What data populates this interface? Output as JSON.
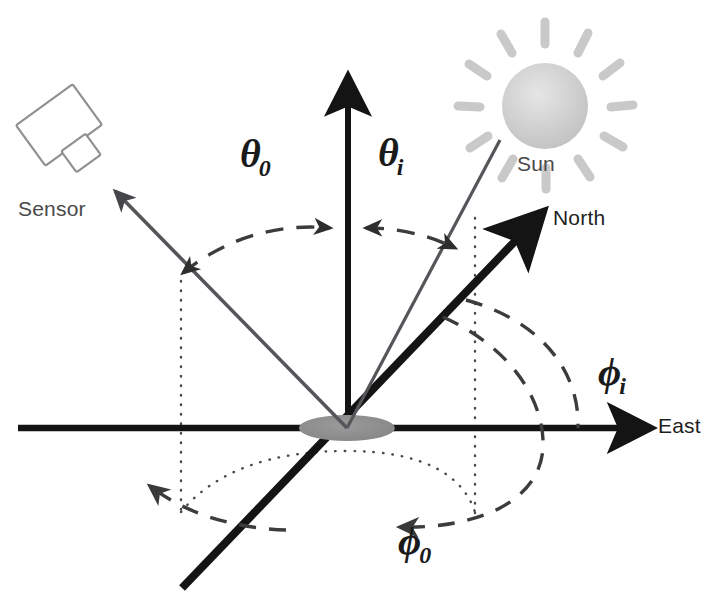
{
  "diagram": {
    "background_color": "#ffffff",
    "labels": {
      "sensor": "Sensor",
      "sun": "Sun",
      "north": "North",
      "east": "East",
      "theta_zero_glyph": "θ",
      "theta_zero_sub": "0",
      "theta_i_glyph": "θ",
      "theta_i_sub": "i",
      "phi_i_glyph": "ϕ",
      "phi_i_sub": "i",
      "phi_zero_glyph": "ϕ",
      "phi_zero_sub": "0"
    },
    "colors": {
      "axis_black": "#141414",
      "ray_gray": "#55565a",
      "sun_gray": "#c9c9c9",
      "sun_core": "#d8d8d8",
      "origin_disk": "#8a8a8a",
      "dashed_arc": "#3c3c3c",
      "dotted_line": "#4a4a4a",
      "sensor_outline": "#8f8f8f",
      "text_gray": "#4a4a4a"
    },
    "geometry": {
      "origin_x": 347,
      "origin_y": 428,
      "zenith_tip_x": 348,
      "zenith_tip_y": 70,
      "east_tip_x": 655,
      "east_tip_y": 428,
      "west_end_x": 18,
      "west_end_y": 428,
      "north_tip_x": 548,
      "north_tip_y": 207,
      "south_end_x": 182,
      "south_end_y": 588,
      "sensor_ray_tip_x": 110,
      "sensor_ray_tip_y": 186,
      "sun_ray_end_x": 500,
      "sun_ray_end_y": 140,
      "origin_disk_rx": 48,
      "origin_disk_ry": 13
    },
    "angles": {
      "theta_zero_description": "view zenith angle between sensor ray and zenith axis",
      "theta_i_description": "solar zenith angle between sun ray and zenith axis",
      "phi_zero_description": "view azimuth angle measured in the horizontal plane",
      "phi_i_description": "solar azimuth angle measured in the horizontal plane"
    }
  }
}
